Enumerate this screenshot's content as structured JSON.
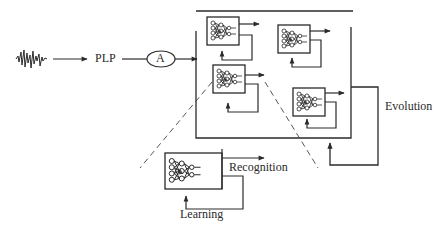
{
  "diagram": {
    "input": {
      "icon": "waveform-icon"
    },
    "feature_label": "PLP",
    "node_label": "A",
    "population": {
      "networks": [
        {
          "id": "net-1",
          "icon": "neural-network-icon"
        },
        {
          "id": "net-2",
          "icon": "neural-network-icon"
        },
        {
          "id": "net-3",
          "icon": "neural-network-icon"
        },
        {
          "id": "net-4",
          "icon": "neural-network-icon"
        }
      ]
    },
    "labels": {
      "evolution": "Evolution",
      "recognition": "Recognition",
      "learning": "Learning"
    },
    "colors": {
      "stroke": "#2a2a2a",
      "background": "#ffffff"
    }
  }
}
